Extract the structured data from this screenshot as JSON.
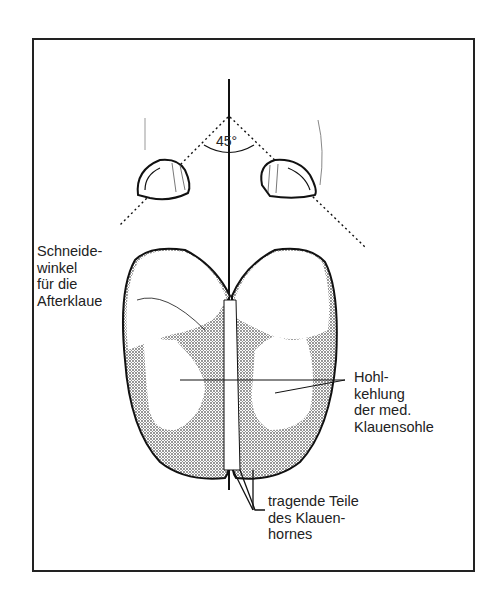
{
  "figure": {
    "angle_label": "45°",
    "labels": {
      "cutting_angle": [
        "Schneide-",
        "winkel",
        "für die",
        "Afterklaue"
      ],
      "sole_concavity": [
        "Hohl-",
        "kehlung",
        "der med.",
        "Klauensohle"
      ],
      "bearing_parts": [
        "tragende Teile",
        "des Klauen-",
        "hornes"
      ]
    },
    "colors": {
      "line": "#111111",
      "shading": "#b8b8b8",
      "background": "#ffffff"
    }
  }
}
